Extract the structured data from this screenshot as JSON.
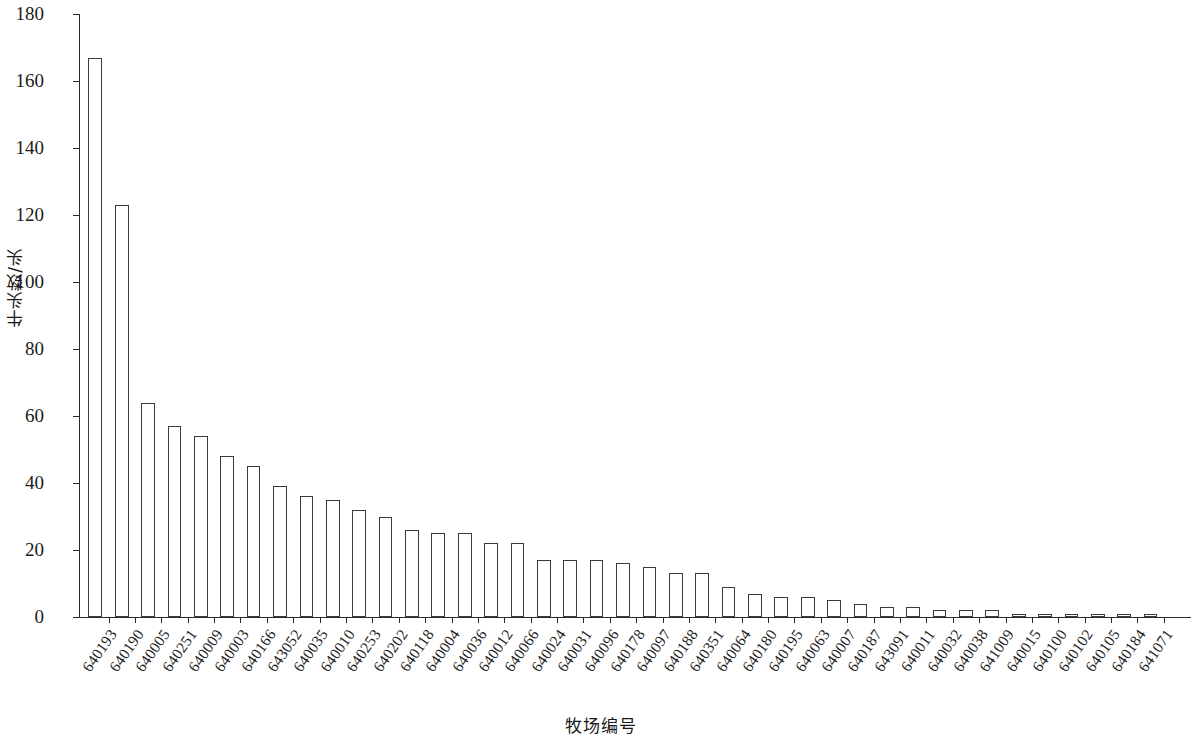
{
  "chart_data": {
    "type": "bar",
    "title": "",
    "xlabel": "牧场编号",
    "ylabel": "牛头数/头",
    "ylim": [
      0,
      180
    ],
    "yticks": [
      0,
      20,
      40,
      60,
      80,
      100,
      120,
      140,
      160,
      180
    ],
    "grid": false,
    "legend": null,
    "bar_style": {
      "fill": "#ffffff",
      "edge": "#3a3a3a"
    },
    "categories": [
      "640193",
      "640190",
      "640005",
      "640251",
      "640009",
      "640003",
      "640166",
      "643052",
      "640035",
      "640010",
      "640253",
      "640202",
      "640118",
      "640004",
      "640036",
      "640012",
      "640066",
      "640024",
      "640031",
      "640096",
      "640178",
      "640097",
      "640188",
      "640351",
      "640064",
      "640180",
      "640195",
      "640063",
      "640007",
      "640187",
      "643091",
      "640011",
      "640032",
      "640038",
      "641009",
      "640015",
      "640100",
      "640102",
      "640105",
      "640184",
      "641071"
    ],
    "values": [
      167,
      123,
      64,
      57,
      54,
      48,
      45,
      39,
      36,
      35,
      32,
      30,
      26,
      25,
      25,
      22,
      22,
      17,
      17,
      17,
      16,
      15,
      13,
      13,
      9,
      7,
      6,
      6,
      5,
      4,
      3,
      3,
      2,
      2,
      2,
      1,
      1,
      1,
      1,
      1,
      1
    ]
  }
}
